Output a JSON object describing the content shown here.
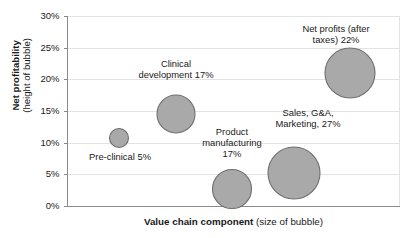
{
  "chart_data": {
    "type": "scatter",
    "subtype": "bubble",
    "title": "",
    "xlabel": "Value chain component",
    "xlabel_suffix": "(size of bubble)",
    "ylabel": "Net profitability",
    "ylabel_suffix": "(height of bubble)",
    "ylim": [
      0,
      30
    ],
    "yticks": [
      0,
      5,
      10,
      15,
      20,
      25,
      30
    ],
    "ytick_labels": [
      "0%",
      "5%",
      "10%",
      "15%",
      "20%",
      "25%",
      "30%"
    ],
    "grid": true,
    "grid_axis": "y",
    "legend": "none",
    "x_axis_categorical": true,
    "bubble_fill": "#a9a9a9",
    "bubble_stroke": "#6e6e6e",
    "gridline_color": "#e3e3e3",
    "axis_color": "#8a8a8a",
    "points": [
      {
        "name": "pre-clinical",
        "label": "Pre-clinical 5%",
        "category": "Pre-clinical",
        "net_profitability_pct": 11.5,
        "value_chain_share_pct": 5,
        "cx": 119,
        "cy": 138,
        "r": 9.5,
        "label_x": 72,
        "label_y": 151,
        "label_w": 96
      },
      {
        "name": "clinical-development",
        "label": "Clinical\ndevelopment 17%",
        "category": "Clinical development",
        "net_profitability_pct": 15,
        "value_chain_share_pct": 17,
        "cx": 176,
        "cy": 114,
        "r": 19,
        "label_x": 126,
        "label_y": 58,
        "label_w": 100
      },
      {
        "name": "product-manufacturing",
        "label": "Product\nmanufacturing\n17%",
        "category": "Product manufacturing",
        "net_profitability_pct": 4,
        "value_chain_share_pct": 17,
        "cx": 232,
        "cy": 189,
        "r": 19.5,
        "label_x": 192,
        "label_y": 126,
        "label_w": 80
      },
      {
        "name": "sales-gna-marketing",
        "label": "Sales, G&A,\nMarketing, 27%",
        "category": "Sales, G&A, Marketing",
        "net_profitability_pct": 6.5,
        "value_chain_share_pct": 27,
        "cx": 294,
        "cy": 173,
        "r": 26,
        "label_x": 258,
        "label_y": 107,
        "label_w": 100
      },
      {
        "name": "net-profits-after-taxes",
        "label": "Net profits (after\ntaxes) 22%",
        "category": "Net profits (after taxes)",
        "net_profitability_pct": 22,
        "value_chain_share_pct": 22,
        "cx": 350,
        "cy": 73,
        "r": 25,
        "label_x": 278,
        "label_y": 23,
        "label_w": 116
      }
    ]
  }
}
